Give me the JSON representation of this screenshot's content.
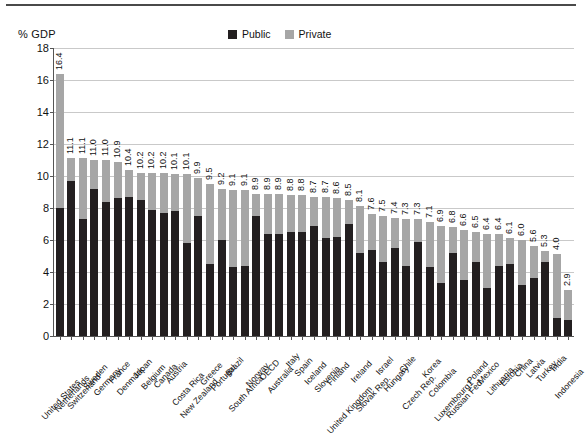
{
  "header": {
    "axis_unit": "% GDP"
  },
  "legend": {
    "position": "top-center",
    "items": [
      {
        "label": "Public",
        "color": "#231f20"
      },
      {
        "label": "Private",
        "color": "#a6a6a6"
      }
    ]
  },
  "colors": {
    "public": "#231f20",
    "private": "#a6a6a6",
    "grid": "#c9c9c9",
    "axis": "#555555",
    "text": "#111111",
    "top_rule": "#4a4a4a",
    "background": "#ffffff"
  },
  "chart_data": {
    "type": "bar",
    "subtype": "stacked-vertical",
    "title": "",
    "subtitle": "",
    "xlabel": "",
    "ylabel": "% GDP",
    "ylim": [
      0,
      18
    ],
    "ytick_step": 2,
    "yticks": [
      "0",
      "2",
      "4",
      "6",
      "8",
      "10",
      "12",
      "14",
      "16",
      "18"
    ],
    "grid": true,
    "legend_entries": [
      "Public",
      "Private"
    ],
    "categories": [
      "United States",
      "Netherlands",
      "Switzerland",
      "Sweden",
      "Germany",
      "France",
      "Denmark",
      "Japan",
      "Belgium",
      "Canada",
      "Austria",
      "Costa Rica",
      "New Zealand",
      "Greece",
      "Portugal",
      "Brazil",
      "South Africa",
      "Norway",
      "OECD",
      "Australia",
      "Italy",
      "Spain",
      "Iceland",
      "Slovenia",
      "Finland",
      "United Kingdom",
      "Ireland",
      "Slovak Rep.",
      "Israel",
      "Hungary",
      "Chile",
      "Czech Rep.",
      "Korea",
      "Colombia",
      "Luxembourg1",
      "Russian Fed.",
      "Poland",
      "Mexico",
      "Lithuania",
      "Estonia",
      "China",
      "Latvia",
      "Turkey",
      "India",
      "Indonesia"
    ],
    "series": [
      {
        "name": "Public",
        "color": "#231f20",
        "values": [
          8.0,
          9.7,
          7.3,
          9.2,
          8.4,
          8.6,
          8.7,
          8.5,
          7.9,
          7.7,
          7.8,
          5.8,
          7.5,
          4.5,
          6.0,
          4.3,
          4.4,
          7.5,
          6.4,
          6.4,
          6.5,
          6.5,
          6.9,
          6.1,
          6.2,
          7.0,
          5.2,
          5.4,
          4.6,
          5.5,
          4.4,
          5.9,
          4.3,
          3.3,
          5.2,
          3.5,
          4.6,
          3.0,
          4.4,
          4.5,
          3.2,
          3.6,
          4.6,
          1.1,
          1.0
        ]
      },
      {
        "name": "Private",
        "color": "#a6a6a6",
        "values": [
          8.4,
          1.4,
          3.7,
          1.8,
          2.6,
          2.3,
          2.2,
          1.7,
          2.3,
          2.5,
          2.3,
          4.3,
          2.4,
          5.0,
          3.2,
          4.8,
          4.7,
          1.5,
          2.5,
          2.5,
          2.3,
          2.2,
          1.8,
          2.5,
          2.4,
          1.5,
          2.9,
          2.1,
          2.9,
          1.8,
          2.9,
          1.4,
          3.0,
          3.6,
          1.6,
          3.1,
          1.9,
          3.5,
          2.0,
          1.6,
          2.4,
          1.7,
          0.5,
          2.9,
          1.9
        ]
      }
    ],
    "totals": [
      16.4,
      11.1,
      11.1,
      11.0,
      11.0,
      10.9,
      10.4,
      10.2,
      10.2,
      10.2,
      10.1,
      10.1,
      9.9,
      9.5,
      9.2,
      9.1,
      9.1,
      8.9,
      8.9,
      8.9,
      8.8,
      8.8,
      8.7,
      8.7,
      8.6,
      8.5,
      8.1,
      7.6,
      7.5,
      7.4,
      7.3,
      7.3,
      7.1,
      6.9,
      6.8,
      6.6,
      6.5,
      6.4,
      6.4,
      6.1,
      6.0,
      5.6,
      5.3,
      5.1,
      4.0
    ],
    "value_labels": [
      "16.4",
      "11.1",
      "11.1",
      "11.0",
      "11.0",
      "10.9",
      "10.4",
      "10.2",
      "10.2",
      "10.2",
      "10.1",
      "10.1",
      "9.9",
      "9.5",
      "9.2",
      "9.1",
      "9.1",
      "8.9",
      "8.9",
      "8.9",
      "8.8",
      "8.8",
      "8.7",
      "8.7",
      "8.6",
      "8.5",
      "8.1",
      "7.6",
      "7.5",
      "7.4",
      "7.3",
      "7.3",
      "7.1",
      "6.9",
      "6.8",
      "6.6",
      "6.5",
      "6.4",
      "6.4",
      "6.1",
      "6.0",
      "5.6",
      "5.3",
      "5.1",
      "4.0"
    ],
    "trailing_values": {
      "note": "last two bars",
      "labels": [
        "4.0",
        "2.9"
      ]
    }
  }
}
